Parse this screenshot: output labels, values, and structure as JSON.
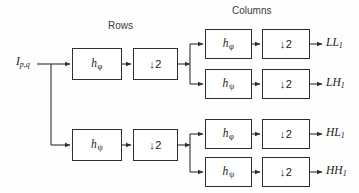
{
  "diagram": {
    "title_rows": "Rows",
    "title_columns": "Columns",
    "input": {
      "base": "I",
      "sub": "p,q"
    },
    "stage_rows": [
      {
        "id": "rows-lowpass",
        "filter": {
          "base": "h",
          "sub": "φ"
        },
        "down": "↓2"
      },
      {
        "id": "rows-highpass",
        "filter": {
          "base": "h",
          "sub": "ψ"
        },
        "down": "↓2"
      }
    ],
    "stage_columns": [
      {
        "id": "cols-ll",
        "filter": {
          "base": "h",
          "sub": "φ"
        },
        "down": "↓2",
        "output": {
          "base": "LL",
          "sub": "1"
        }
      },
      {
        "id": "cols-lh",
        "filter": {
          "base": "h",
          "sub": "ψ"
        },
        "down": "↓2",
        "output": {
          "base": "LH",
          "sub": "1"
        }
      },
      {
        "id": "cols-hl",
        "filter": {
          "base": "h",
          "sub": "φ"
        },
        "down": "↓2",
        "output": {
          "base": "HL",
          "sub": "1"
        }
      },
      {
        "id": "cols-hh",
        "filter": {
          "base": "h",
          "sub": "ψ"
        },
        "down": "↓2",
        "output": {
          "base": "HH",
          "sub": "1"
        }
      }
    ],
    "colors": {
      "stroke": "#2f2f2f",
      "box_fill": "#ffffff",
      "background": "#fefefe",
      "text": "#1a1a1a"
    }
  }
}
